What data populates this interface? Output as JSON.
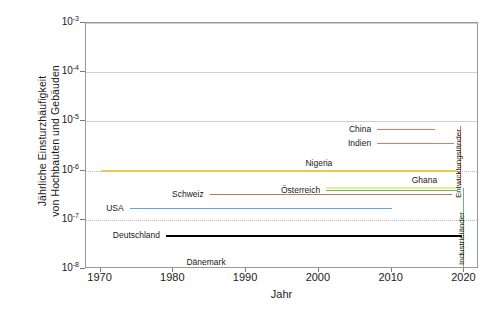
{
  "chart_data": {
    "type": "line",
    "title": "",
    "xlabel": "Jahr",
    "ylabel": "Jährliche Einsturzhäufigkeit\nvon Hochbauten und Gebäuden",
    "xlim": [
      1968,
      2022
    ],
    "ylim": [
      1e-08,
      0.001
    ],
    "yscale": "log",
    "grid": true,
    "legend_position": "inline-labels",
    "xticks": [
      "1970",
      "1980",
      "1990",
      "2000",
      "2010",
      "2020"
    ],
    "xtick_values": [
      1970,
      1980,
      1990,
      2000,
      2010,
      2020
    ],
    "yticks": [
      "10-3",
      "10-4",
      "10-5",
      "10-6",
      "10-7",
      "10-8"
    ],
    "ytick_mantissa": "10",
    "ytick_exponents": [
      "-3",
      "-4",
      "-5",
      "-6",
      "-7",
      "-8"
    ],
    "ytick_values": [
      0.001,
      0.0001,
      1e-05,
      1e-06,
      1e-07,
      1e-08
    ],
    "series": [
      {
        "name": "China",
        "label": "China",
        "color": "#ef7559",
        "value": 7e-06,
        "x_start": 2008.0,
        "x_end": 2016.0,
        "label_side": "left",
        "thickness": 1.6
      },
      {
        "name": "Indien",
        "label": "Indien",
        "color": "#ef7559",
        "value": 3.6e-06,
        "x_start": 2008.0,
        "x_end": 2018.6,
        "label_side": "left",
        "thickness": 1.6
      },
      {
        "name": "Nigeria",
        "label": "Nigeria",
        "color": "#e8cb4f",
        "value": 1.05e-06,
        "x_start": 1970.0,
        "x_end": 2019.0,
        "label_side": "above",
        "label_x": 2000.0,
        "thickness": 2.2
      },
      {
        "name": "Ghana",
        "label": "Ghana",
        "color": "#f2ea8e",
        "value": 4.6e-07,
        "x_start": 2001.0,
        "x_end": 2019.0,
        "label_side": "above",
        "label_x": 2014.5,
        "thickness": 2.6
      },
      {
        "name": "Österreich",
        "label": "Österreich",
        "color": "#6eb86e",
        "value": 4e-07,
        "x_start": 2001.0,
        "x_end": 2019.0,
        "label_side": "left",
        "thickness": 1.6
      },
      {
        "name": "Schweiz",
        "label": "Schweiz",
        "color": "#c07a50",
        "value": 3.4e-07,
        "x_start": 1985.0,
        "x_end": 2018.3,
        "label_side": "left",
        "thickness": 1.5
      },
      {
        "name": "USA",
        "label": "USA",
        "color": "#5fa8e0",
        "value": 1.75e-07,
        "x_start": 1974.0,
        "x_end": 2010.0,
        "label_side": "left",
        "thickness": 1.6
      },
      {
        "name": "Deutschland",
        "label": "Deutschland",
        "color": "#000000",
        "value": 4.9e-08,
        "x_start": 1979.0,
        "x_end": 2019.6,
        "label_side": "left",
        "thickness": 2.0
      },
      {
        "name": "Dänemark",
        "label": "Dänemark",
        "color": "#a8d4ec",
        "value": 1.02e-08,
        "x_start": 1981.6,
        "x_end": 1984.2,
        "label_side": "above",
        "label_x": 1984.5,
        "thickness": 3.0
      }
    ],
    "group_markers": [
      {
        "name": "Entwicklungsländer",
        "label": "Entwicklungsländer",
        "color": "#ef7559",
        "x": 2019.4,
        "y_top": 8e-06,
        "y_bottom": 5.2e-07,
        "caption_x": 2020.0,
        "caption_y_center": 2e-06
      },
      {
        "name": "Industrieländer",
        "label": "Industrieländer",
        "color": "#6eb86e",
        "x": 2019.8,
        "y_top": 4.4e-07,
        "y_bottom": 1e-08,
        "caption_x": 2020.4,
        "caption_y_center": 6e-08
      }
    ]
  },
  "axes": {
    "x_title": "Jahr",
    "y_title": "Jährliche Einsturzhäufigkeit\nvon Hochbauten und Gebäuden"
  }
}
